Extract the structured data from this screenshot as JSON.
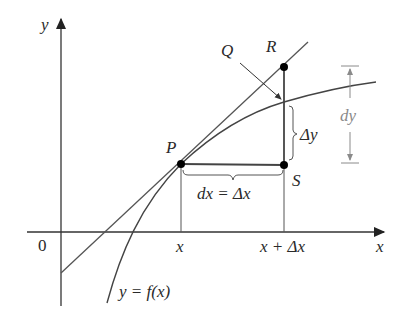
{
  "diagram": {
    "axes": {
      "x_label": "x",
      "y_label": "y",
      "origin_label": "0"
    },
    "points": {
      "P": "P",
      "Q": "Q",
      "R": "R",
      "S": "S"
    },
    "labels": {
      "curve": "y = f(x)",
      "dx_eq": "dx = Δx",
      "delta_y": "Δy",
      "dy": "dy",
      "x_tick": "x",
      "x_plus_dx_tick": "x + Δx"
    },
    "colors": {
      "line": "#3a3a3a",
      "curve": "#4a4a4a",
      "tangent": "#5a5a5a",
      "dimension": "#8a8a8a",
      "point": "#000000"
    }
  }
}
